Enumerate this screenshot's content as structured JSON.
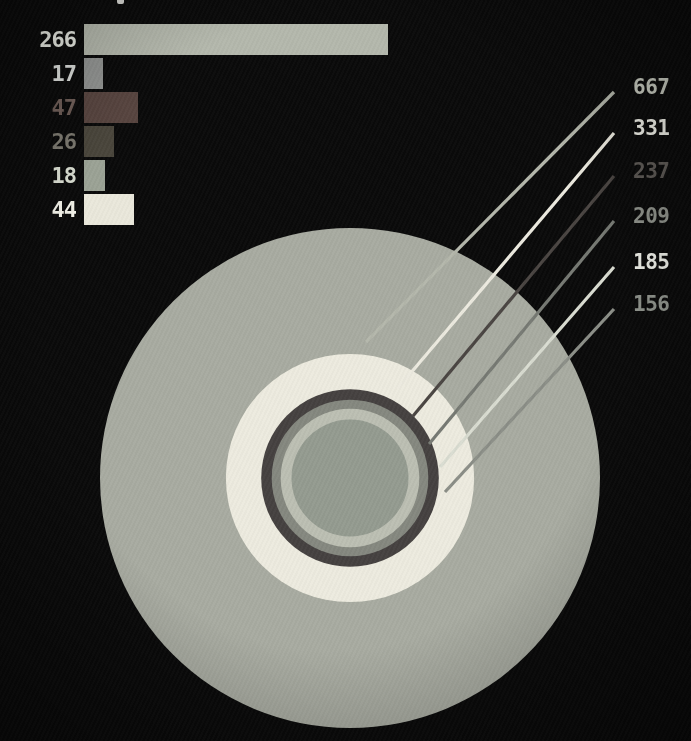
{
  "background_color": "#0a0a0a",
  "chart_data": [
    {
      "type": "bar",
      "orientation": "horizontal",
      "title": "",
      "xlabel": "",
      "ylabel": "",
      "categories": [
        "266",
        "17",
        "47",
        "26",
        "18",
        "44"
      ],
      "values": [
        266,
        17,
        47,
        26,
        18,
        44
      ],
      "bar_colors": [
        "#b4b8ac",
        "#919391",
        "#57443f",
        "#49453b",
        "#9ba295",
        "#eae8db"
      ],
      "label_colors": [
        "#e9ebe3",
        "#dcdedb",
        "#6e5d57",
        "#7b786f",
        "#d9ddd1",
        "#f0efe6"
      ],
      "value_labels_position": "left-of-bar",
      "grid": false,
      "background": "#0a0a0a"
    },
    {
      "type": "concentric-circles",
      "title": "",
      "labels": [
        "667",
        "331",
        "237",
        "209",
        "185",
        "156"
      ],
      "values": [
        667,
        331,
        237,
        209,
        185,
        156
      ],
      "ring_colors": [
        "#a8aba1",
        "#edebdf",
        "#454140",
        "#85887f",
        "#bcbfb3",
        "#949b90"
      ],
      "label_colors": [
        "#c9ccc1",
        "#f0f0e8",
        "#5e5a56",
        "#8f928b",
        "#eff0e9",
        "#90948d"
      ],
      "line_colors": [
        "#b4b7ab",
        "#eceadf",
        "#4a4542",
        "#767973",
        "#d9dcd1",
        "#8b8e87"
      ],
      "radius_proportional_to": "value",
      "labels_position": "right",
      "legend": "callout-lines"
    }
  ]
}
